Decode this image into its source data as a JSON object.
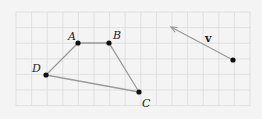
{
  "colors": {
    "background": "#f4f4f4",
    "grid": "#dcdcdc",
    "segment": "#9a9a9a",
    "point": "#111111",
    "label": "#222222"
  },
  "grid": {
    "x0": 16,
    "y0": 12,
    "cell": 15.6,
    "cols": 15,
    "rows": 6
  },
  "quadrilateral": {
    "points": [
      {
        "name": "A",
        "x": 78,
        "y": 43,
        "lx": 68,
        "ly": 40
      },
      {
        "name": "B",
        "x": 109,
        "y": 43,
        "lx": 113,
        "ly": 39
      },
      {
        "name": "C",
        "x": 139,
        "y": 92,
        "lx": 142,
        "ly": 107
      },
      {
        "name": "D",
        "x": 46,
        "y": 75,
        "lx": 32,
        "ly": 72
      }
    ]
  },
  "vector": {
    "label": "v",
    "tail": {
      "x": 233,
      "y": 60
    },
    "head": {
      "x": 171,
      "y": 27
    },
    "label_pos": {
      "x": 205,
      "y": 42
    }
  }
}
